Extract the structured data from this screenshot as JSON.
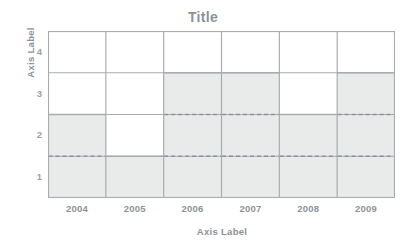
{
  "top_sliver": {
    "text": ""
  },
  "chart_data": {
    "type": "bar",
    "title": "Title",
    "xlabel": "Axis Label",
    "ylabel": "Axis Label",
    "categories": [
      "2004",
      "2005",
      "2006",
      "2007",
      "2008",
      "2009"
    ],
    "values": [
      2.5,
      1.5,
      3.5,
      3.5,
      2.5,
      3.5
    ],
    "yticks": [
      "1",
      "2",
      "3",
      "4"
    ],
    "ytick_values": [
      1,
      2,
      3,
      4
    ],
    "ylim": [
      0.5,
      4.5
    ],
    "gridlines_y": [
      1.5,
      2.5,
      3.5
    ],
    "dashed_reference_lines": [
      1.5,
      2.5
    ],
    "grid": true,
    "legend": "none",
    "colors": {
      "bar_fill": "#e9eaea",
      "bar_edge": "#a8acb0",
      "grid_line": "#a8acb0",
      "dashed_line": "#8f9398",
      "axis_frame": "#a8acb0",
      "title_text": "#8d9299",
      "axis_label_text": "#8d9299",
      "tick_text": "#9ba0a6",
      "background": "#ffffff"
    }
  }
}
